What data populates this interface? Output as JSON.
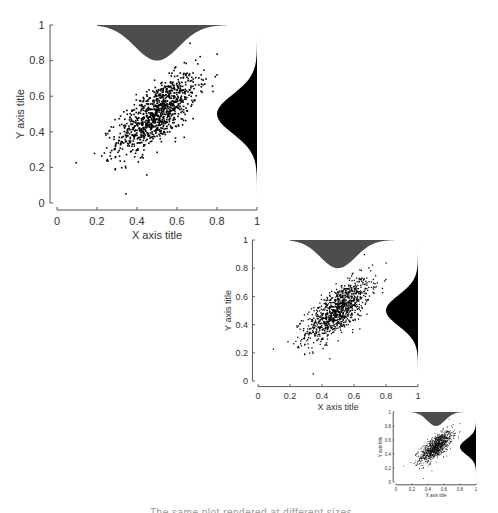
{
  "chart_data": [
    {
      "type": "scatter",
      "title": "",
      "xlabel": "X axis title",
      "ylabel": "Y axis title",
      "xlim": [
        0,
        1
      ],
      "ylim": [
        0,
        1
      ],
      "xticks": [
        "0",
        "0.2",
        "0.4",
        "0.6",
        "0.8",
        "1"
      ],
      "yticks": [
        "0",
        "0.2",
        "0.4",
        "0.6",
        "0.8",
        "1"
      ],
      "grid": false,
      "legend": null,
      "marginals": {
        "top": {
          "type": "density",
          "color": "#4d4d4d",
          "peak_x": 0.5,
          "sd": 0.11
        },
        "right": {
          "type": "density",
          "color": "#000000",
          "peak_y": 0.5,
          "sd": 0.11
        }
      },
      "series": [
        {
          "name": "points",
          "n_points": 1000,
          "mean_x": 0.5,
          "mean_y": 0.5,
          "sd_x": 0.1,
          "sd_y": 0.11,
          "correlation": 0.7,
          "marker_color": "#000000"
        }
      ],
      "panel": {
        "x": 57,
        "y": 25,
        "w": 200,
        "h": 178,
        "font": 11,
        "marker": 1.6
      }
    },
    {
      "type": "scatter",
      "title": "",
      "xlabel": "X axis title",
      "ylabel": "Y axis title",
      "xlim": [
        0,
        1
      ],
      "ylim": [
        0,
        1
      ],
      "xticks": [
        "0",
        "0.2",
        "0.4",
        "0.6",
        "0.8",
        "1"
      ],
      "yticks": [
        "0",
        "0.2",
        "0.4",
        "0.6",
        "0.8",
        "1"
      ],
      "grid": false,
      "legend": null,
      "marginals": {
        "top": {
          "type": "density",
          "color": "#4d4d4d",
          "peak_x": 0.5,
          "sd": 0.11
        },
        "right": {
          "type": "density",
          "color": "#000000",
          "peak_y": 0.5,
          "sd": 0.11
        }
      },
      "series": [
        {
          "name": "points",
          "n_points": 1000,
          "mean_x": 0.5,
          "mean_y": 0.5,
          "sd_x": 0.1,
          "sd_y": 0.11,
          "correlation": 0.7,
          "marker_color": "#000000"
        }
      ],
      "panel": {
        "x": 258,
        "y": 240,
        "w": 160,
        "h": 141,
        "font": 9,
        "marker": 1.3
      }
    },
    {
      "type": "scatter",
      "title": "",
      "xlabel": "X axis title",
      "ylabel": "Y axis title",
      "xlim": [
        0,
        1
      ],
      "ylim": [
        0,
        1
      ],
      "xticks": [
        "0",
        "0.2",
        "0.4",
        "0.6",
        "0.8",
        "1"
      ],
      "yticks": [
        "0",
        "0.2",
        "0.4",
        "0.6",
        "0.8",
        "1"
      ],
      "grid": false,
      "legend": null,
      "marginals": {
        "top": {
          "type": "density",
          "color": "#4d4d4d",
          "peak_x": 0.5,
          "sd": 0.11
        },
        "right": {
          "type": "density",
          "color": "#000000",
          "peak_y": 0.5,
          "sd": 0.11
        }
      },
      "series": [
        {
          "name": "points",
          "n_points": 1000,
          "mean_x": 0.5,
          "mean_y": 0.5,
          "sd_x": 0.1,
          "sd_y": 0.11,
          "correlation": 0.7,
          "marker_color": "#000000"
        }
      ],
      "panel": {
        "x": 396,
        "y": 412,
        "w": 80,
        "h": 70,
        "font": 4.5,
        "marker": 0.8
      }
    }
  ],
  "caption": "The same plot rendered at different sizes"
}
